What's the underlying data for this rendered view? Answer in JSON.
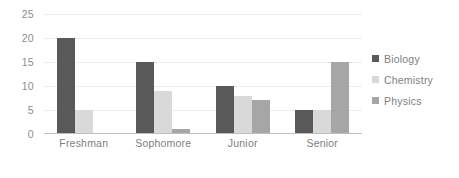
{
  "chart_data": {
    "type": "bar",
    "title": "",
    "subtitle": "",
    "xlabel": "",
    "ylabel": "",
    "categories": [
      "Freshman",
      "Sophomore",
      "Junior",
      "Senior"
    ],
    "series": [
      {
        "name": "Biology",
        "color": "#595959",
        "values": [
          20,
          15,
          10,
          5
        ]
      },
      {
        "name": "Chemistry",
        "color": "#d9d9d9",
        "values": [
          5,
          9,
          8,
          5
        ]
      },
      {
        "name": "Physics",
        "color": "#a6a6a6",
        "values": [
          0,
          1,
          7,
          15
        ]
      }
    ],
    "ylim": [
      0,
      25
    ],
    "ytick_values": [
      0,
      5,
      10,
      15,
      20,
      25
    ],
    "ytick_labels": [
      "0",
      "5",
      "10",
      "15",
      "20",
      "25"
    ],
    "grid": true,
    "grid_color": "#ececec",
    "axis_color": "#bfbfbf",
    "legend_position": "right",
    "legend_entries": [
      "Biology",
      "Chemistry",
      "Physics"
    ],
    "background_color": "#ffffff",
    "tick_label_color": "#8c8c8c"
  }
}
